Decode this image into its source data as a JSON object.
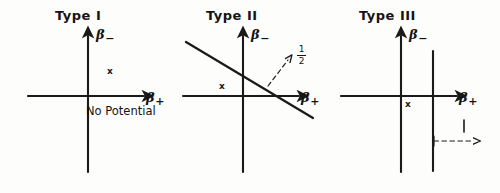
{
  "figure": {
    "ink_color": "#1a1a1a",
    "background_color": "#fdfdfc"
  },
  "panels": [
    {
      "id": "type-1",
      "title": "Type I",
      "axis_x_label": "β",
      "axis_x_subscript": "+",
      "axis_y_label": "β",
      "axis_y_subscript": "−",
      "point_marker": "x",
      "note": "No Potential"
    },
    {
      "id": "type-2",
      "title": "Type II",
      "axis_x_label": "β",
      "axis_x_subscript": "+",
      "axis_y_label": "β",
      "axis_y_subscript": "−",
      "point_marker": "x",
      "slope_numerator": "1",
      "slope_denominator": "2"
    },
    {
      "id": "type-3",
      "title": "Type III",
      "axis_x_label": "β",
      "axis_x_subscript": "+",
      "axis_y_label": "β",
      "axis_y_subscript": "−",
      "point_marker": "x",
      "length_label": "l"
    }
  ]
}
